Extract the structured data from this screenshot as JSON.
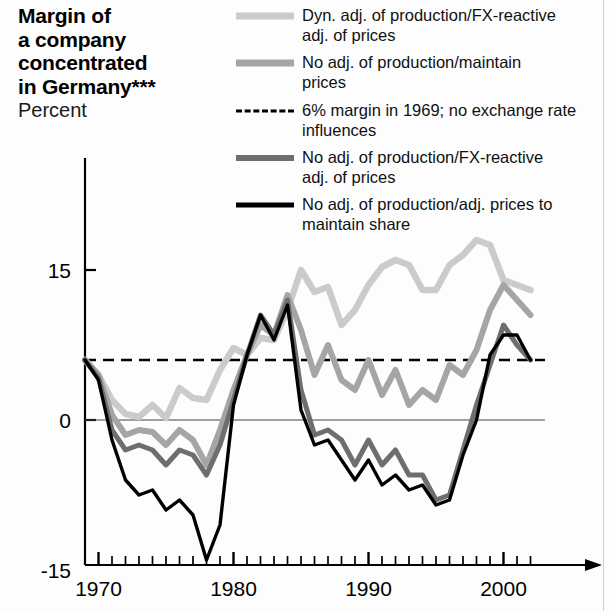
{
  "title": {
    "main": "Margin of\na company\nconcentrated\nin Germany***",
    "sub": "Percent"
  },
  "legend": [
    {
      "id": "dyn-adj-fx-reactive",
      "label": "Dyn. adj. of production/FX-reactive\nadj. of prices",
      "style": "solid",
      "color": "#cbcbcb",
      "width": 7
    },
    {
      "id": "no-adj-maintain-prices",
      "label": "No adj. of production/maintain\nprices",
      "style": "solid",
      "color": "#a5a5a5",
      "width": 7
    },
    {
      "id": "six-pct-margin-1969",
      "label": "6% margin in 1969; no exchange rate\ninfluences",
      "style": "dashed",
      "color": "#000000",
      "width": 3
    },
    {
      "id": "no-adj-fx-reactive",
      "label": "No adj. of production/FX-reactive\nadj. of prices",
      "style": "solid",
      "color": "#6e6e6e",
      "width": 6
    },
    {
      "id": "no-adj-maintain-share",
      "label": "No adj. of production/adj. prices to\nmaintain share",
      "style": "solid",
      "color": "#000000",
      "width": 5
    }
  ],
  "chart_data": {
    "type": "line",
    "title": "Margin of a company concentrated in Germany***",
    "ylabel": "Percent",
    "xlabel": "",
    "ylim": [
      -15,
      20
    ],
    "xlim": [
      1968.5,
      2002.5
    ],
    "yticks": [
      15,
      0,
      -15
    ],
    "ytick_labels": [
      "15",
      "0",
      "-15"
    ],
    "xticks": [
      1970,
      1980,
      1990,
      2000
    ],
    "xtick_labels": [
      "1970",
      "1980",
      "1990",
      "2000"
    ],
    "minor_xticks_every": 1,
    "grid": false,
    "zero_line": true,
    "reference_line": {
      "value": 6,
      "style": "dashed",
      "label": "6% margin in 1969; no exchange rate influences"
    },
    "legend_position": "top-right",
    "x": [
      1969,
      1970,
      1971,
      1972,
      1973,
      1974,
      1975,
      1976,
      1977,
      1978,
      1979,
      1980,
      1981,
      1982,
      1983,
      1984,
      1985,
      1986,
      1987,
      1988,
      1989,
      1990,
      1991,
      1992,
      1993,
      1994,
      1995,
      1996,
      1997,
      1998,
      1999,
      2000,
      2001,
      2002
    ],
    "series": [
      {
        "name": "Dyn. adj. of production/FX-reactive adj. of prices",
        "color": "#cbcbcb",
        "values": [
          6.0,
          4.5,
          2.0,
          0.6,
          0.3,
          1.5,
          0.2,
          3.2,
          2.2,
          2.0,
          5.0,
          7.2,
          6.5,
          8.2,
          8.0,
          11.0,
          15.0,
          12.8,
          13.3,
          9.5,
          11.0,
          13.5,
          15.3,
          16.0,
          15.5,
          13.0,
          13.0,
          15.5,
          16.5,
          18.0,
          17.5,
          14.0,
          13.5,
          13.0
        ]
      },
      {
        "name": "No adj. of production/maintain prices",
        "color": "#a5a5a5",
        "values": [
          6.0,
          4.5,
          0.5,
          -1.5,
          -1.0,
          -1.2,
          -2.5,
          -1.0,
          -2.0,
          -4.5,
          -1.0,
          3.0,
          6.5,
          9.5,
          8.5,
          12.5,
          9.0,
          4.5,
          7.5,
          4.0,
          3.0,
          6.0,
          2.5,
          5.0,
          1.5,
          3.0,
          2.0,
          5.5,
          4.5,
          7.0,
          11.0,
          13.5,
          12.0,
          10.5
        ]
      },
      {
        "name": "No adj. of production/FX-reactive adj. of prices",
        "color": "#6e6e6e",
        "values": [
          6.0,
          4.2,
          -1.0,
          -3.0,
          -2.5,
          -3.0,
          -4.5,
          -3.0,
          -3.5,
          -5.5,
          -2.5,
          2.0,
          6.5,
          10.5,
          8.5,
          12.0,
          3.0,
          -1.5,
          -1.0,
          -2.0,
          -4.5,
          -2.0,
          -4.5,
          -3.0,
          -5.5,
          -5.5,
          -8.0,
          -7.5,
          -3.0,
          1.5,
          5.5,
          9.5,
          7.5,
          6.0
        ]
      },
      {
        "name": "No adj. of production/adj. prices to maintain share",
        "color": "#000000",
        "values": [
          6.0,
          4.0,
          -2.0,
          -6.0,
          -7.5,
          -7.0,
          -9.0,
          -8.0,
          -9.5,
          -14.0,
          -10.5,
          1.5,
          6.5,
          10.5,
          8.0,
          11.5,
          1.0,
          -2.5,
          -2.0,
          -4.0,
          -6.0,
          -4.0,
          -6.5,
          -5.5,
          -7.0,
          -6.5,
          -8.5,
          -8.0,
          -3.5,
          0.0,
          6.5,
          8.5,
          8.5,
          6.0
        ]
      }
    ]
  },
  "axes": {
    "origin_px": {
      "x": 85,
      "y": 420
    },
    "x_per_year_px": 13.5,
    "y_per_unit_px": 10
  }
}
